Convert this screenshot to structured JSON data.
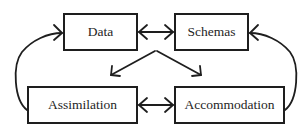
{
  "diagram": {
    "nodes": {
      "data": {
        "label": "Data"
      },
      "schemas": {
        "label": "Schemas"
      },
      "assimilation": {
        "label": "Assimilation"
      },
      "accommodation": {
        "label": "Accommodation"
      }
    },
    "edges": [
      {
        "from": "Data",
        "to": "Schemas",
        "type": "bidirectional"
      },
      {
        "from": "Assimilation",
        "to": "Accommodation",
        "type": "bidirectional"
      },
      {
        "from": "Data/Schemas",
        "to": "Assimilation",
        "type": "arrow"
      },
      {
        "from": "Data/Schemas",
        "to": "Accommodation",
        "type": "arrow"
      },
      {
        "from": "Assimilation",
        "to": "Data",
        "type": "curved-arrow"
      },
      {
        "from": "Accommodation",
        "to": "Schemas",
        "type": "curved-arrow"
      }
    ],
    "colors": {
      "stroke": "#1e1e1e",
      "background": "#ffffff"
    }
  }
}
